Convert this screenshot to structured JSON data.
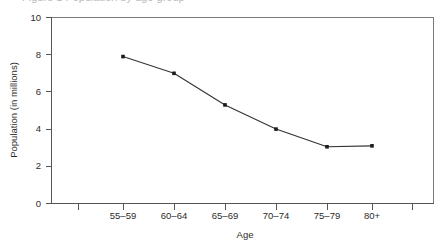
{
  "figure": {
    "background_color": "#ffffff",
    "width": 446,
    "height": 244,
    "clipped_top_text": "Figure 1  Population by age group"
  },
  "chart_data": {
    "type": "line",
    "title": "",
    "subtitle": "",
    "xlabel": "Age",
    "ylabel": "Population (in millions)",
    "categories": [
      "55–59",
      "60–64",
      "65–69",
      "70–74",
      "75–79",
      "80+"
    ],
    "values": [
      7.9,
      7.0,
      5.3,
      4.0,
      3.05,
      3.1
    ],
    "series": [
      {
        "name": "Population",
        "values": [
          7.9,
          7.0,
          5.3,
          4.0,
          3.05,
          3.1
        ]
      }
    ],
    "ylim": [
      0,
      10
    ],
    "y_ticks": [
      0,
      2,
      4,
      6,
      8,
      10
    ],
    "y_tick_labels": [
      "0",
      "2",
      "4",
      "6",
      "8",
      "10"
    ],
    "x_tick_labels": [
      "",
      "55–59",
      "60–64",
      "65–69",
      "70–74",
      "75–79",
      "80+",
      ""
    ],
    "grid": false,
    "legend": null,
    "legend_position": "none",
    "marker": "square",
    "line_color": "#333333",
    "marker_color": "#1c1c1c",
    "axis_color": "#555555",
    "frame_color": "#7a7a7a",
    "annotations": []
  },
  "axes": {
    "y_title": "Population (in millions)",
    "x_title": "Age",
    "y_tick_labels": [
      "10",
      "8",
      "6",
      "4",
      "2",
      "0"
    ],
    "x_tick_labels": [
      "55–59",
      "60–64",
      "65–69",
      "70–74",
      "75–79",
      "80+"
    ]
  }
}
